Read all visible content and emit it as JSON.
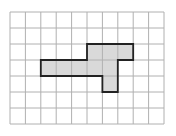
{
  "diagram": {
    "type": "grid-shape",
    "grid": {
      "columns": 10,
      "rows": 7,
      "origin_x": 10,
      "origin_y": 12,
      "cell_w": 15.4,
      "cell_h": 16,
      "line_color": "#b0b0b0"
    },
    "shape": {
      "fill": "#d9d9d9",
      "stroke": "#222222",
      "cells": [
        [
          2,
          5
        ],
        [
          2,
          6
        ],
        [
          2,
          7
        ],
        [
          3,
          2
        ],
        [
          3,
          3
        ],
        [
          3,
          4
        ],
        [
          3,
          5
        ],
        [
          3,
          6
        ],
        [
          4,
          6
        ]
      ],
      "outline_grid_points": [
        [
          2,
          3
        ],
        [
          5,
          3
        ],
        [
          5,
          2
        ],
        [
          8,
          2
        ],
        [
          8,
          3
        ],
        [
          7,
          3
        ],
        [
          7,
          5
        ],
        [
          6,
          5
        ],
        [
          6,
          4
        ],
        [
          2,
          4
        ]
      ]
    }
  }
}
